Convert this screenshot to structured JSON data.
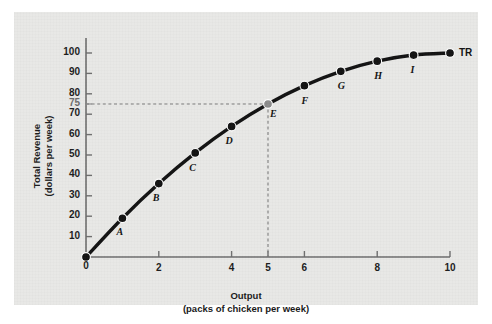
{
  "figure": {
    "background_color": "#e8e8e6",
    "page_color": "#ffffff"
  },
  "chart_data": {
    "type": "line",
    "title": "",
    "xlabel": "Output",
    "xlabel_sub": "(packs of chicken per week)",
    "ylabel": "Total Revenue",
    "ylabel_sub": "(dollars per week)",
    "xlim": [
      0,
      10.4
    ],
    "ylim": [
      0,
      105
    ],
    "grid": false,
    "legend": "none",
    "series_name": "TR",
    "series_label_text": "TR",
    "x": [
      0,
      1,
      2,
      3,
      4,
      5,
      6,
      7,
      8,
      9,
      10
    ],
    "values": [
      0,
      19,
      36,
      51,
      64,
      75,
      84,
      91,
      96,
      99,
      100
    ],
    "point_labels": [
      "",
      "A",
      "B",
      "C",
      "D",
      "E",
      "F",
      "G",
      "H",
      "I",
      ""
    ],
    "highlight_point": {
      "label": "E",
      "x": 5,
      "y": 75,
      "color": "#8b8b8b",
      "guide_x_label": "5",
      "guide_y_label": "75"
    },
    "xticks": [
      {
        "value": 0,
        "label": "0"
      },
      {
        "value": 2,
        "label": "2"
      },
      {
        "value": 4,
        "label": "4"
      },
      {
        "value": 5,
        "label": "5"
      },
      {
        "value": 6,
        "label": "6"
      },
      {
        "value": 8,
        "label": "8"
      },
      {
        "value": 10,
        "label": "10"
      }
    ],
    "yticks": [
      {
        "value": 10,
        "label": "10"
      },
      {
        "value": 20,
        "label": "20"
      },
      {
        "value": 30,
        "label": "30"
      },
      {
        "value": 40,
        "label": "40"
      },
      {
        "value": 50,
        "label": "50"
      },
      {
        "value": 60,
        "label": "60"
      },
      {
        "value": 70,
        "label": "70"
      },
      {
        "value": 75,
        "label": "75"
      },
      {
        "value": 80,
        "label": "80"
      },
      {
        "value": 90,
        "label": "90"
      },
      {
        "value": 100,
        "label": "100"
      }
    ],
    "colors": {
      "curve": "#111111",
      "point": "#111111",
      "highlight": "#8b8b8b",
      "axis": "#6d6d6d",
      "guide": "#7a7a7a",
      "text": "#1a1a1a"
    }
  }
}
